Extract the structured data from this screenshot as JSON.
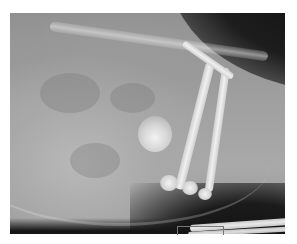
{
  "image": {
    "type": "radiograph",
    "description": "Lateral X-ray of a small animal showing abdomen, spine and limb bones",
    "background_color": "#ffffff",
    "tone_colors": {
      "soft_tissue": "#a8a8a8",
      "bone": "#e8e8e8",
      "air_background": "#111111"
    }
  }
}
